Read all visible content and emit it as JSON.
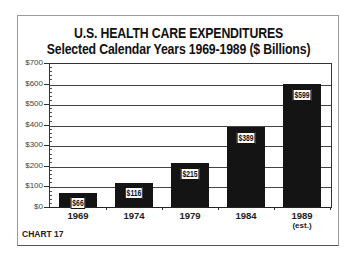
{
  "chart_data": {
    "type": "bar",
    "title": "U.S. HEALTH CARE EXPENDITURES",
    "subtitle": "Selected Calendar Years 1969-1989 ($ Billions)",
    "categories": [
      "1969",
      "1974",
      "1979",
      "1984",
      "1989"
    ],
    "category_subtitles": [
      "",
      "",
      "",
      "",
      "(est.)"
    ],
    "values": [
      66,
      116,
      215,
      389,
      599
    ],
    "value_labels": [
      "$66",
      "$116",
      "$215",
      "$389",
      "$599"
    ],
    "xlabel": "",
    "ylabel": "",
    "ylim": [
      0,
      700
    ],
    "yticks": [
      "$0",
      "$100",
      "$200",
      "$300",
      "$400",
      "$500",
      "$600",
      "$700"
    ],
    "grid": true,
    "legend": null,
    "bar_color": "#141414",
    "caption": "CHART 17"
  }
}
